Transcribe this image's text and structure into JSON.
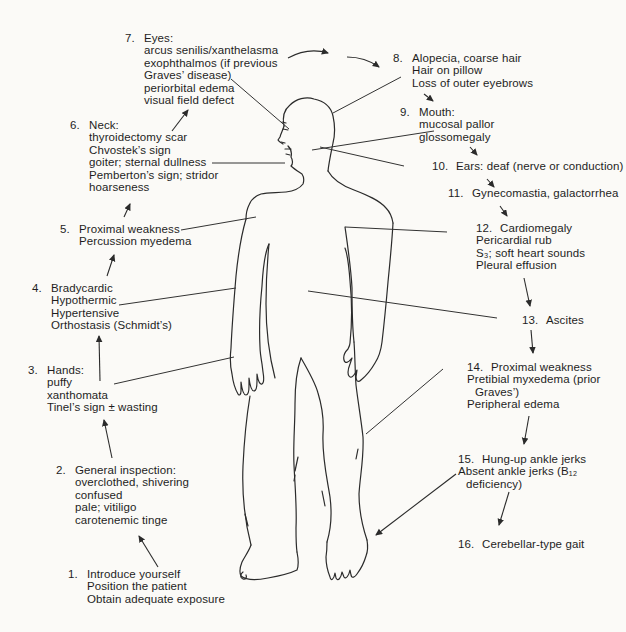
{
  "colors": {
    "ink": "#2b2b2b",
    "background": "#fbfaf7"
  },
  "steps": [
    {
      "num": "1.",
      "lines": [
        "Introduce yourself",
        "Position the patient",
        "Obtain adequate exposure"
      ]
    },
    {
      "num": "2.",
      "lines": [
        "General inspection:",
        "overclothed, shivering",
        "confused",
        "pale; vitiligo",
        "carotenemic tinge"
      ]
    },
    {
      "num": "3.",
      "lines": [
        "Hands:",
        "puffy",
        "xanthomata",
        "Tinel’s sign ± wasting"
      ]
    },
    {
      "num": "4.",
      "lines": [
        "Bradycardic",
        "Hypothermic",
        "Hypertensive",
        "Orthostasis (Schmidt’s)"
      ]
    },
    {
      "num": "5.",
      "lines": [
        "Proximal weakness",
        "Percussion myedema"
      ]
    },
    {
      "num": "6.",
      "lines": [
        "Neck:",
        "thyroidectomy scar",
        "Chvostek’s sign",
        "goiter; sternal dullness",
        "Pemberton’s sign; stridor",
        "hoarseness"
      ]
    },
    {
      "num": "7.",
      "lines": [
        "Eyes:",
        "arcus senilis/xanthelasma",
        "exophthalmos (if previous",
        "Graves’ disease)",
        "periorbital edema",
        "visual field defect"
      ]
    },
    {
      "num": "8.",
      "lines": [
        "Alopecia, coarse hair",
        "Hair on pillow",
        "Loss of outer eyebrows"
      ]
    },
    {
      "num": "9.",
      "lines": [
        "Mouth:",
        "mucosal pallor",
        "glossomegaly"
      ]
    },
    {
      "num": "10.",
      "lines": [
        "Ears: deaf (nerve or conduction)"
      ]
    },
    {
      "num": "11.",
      "lines": [
        "Gynecomastia, galactorrhea"
      ]
    },
    {
      "num": "12.",
      "lines": [
        "Cardiomegaly",
        "Pericardial rub",
        "S₃; soft heart sounds",
        "Pleural effusion"
      ]
    },
    {
      "num": "13.",
      "lines": [
        "Ascites"
      ]
    },
    {
      "num": "14.",
      "lines": [
        "Proximal weakness",
        "Pretibial myxedema (prior",
        "Graves’)",
        "Peripheral edema"
      ]
    },
    {
      "num": "15.",
      "lines": [
        "Hung-up ankle jerks",
        "Absent ankle jerks (B₁₂",
        "deficiency)"
      ]
    },
    {
      "num": "16.",
      "lines": [
        "Cerebellar-type gait"
      ]
    }
  ]
}
